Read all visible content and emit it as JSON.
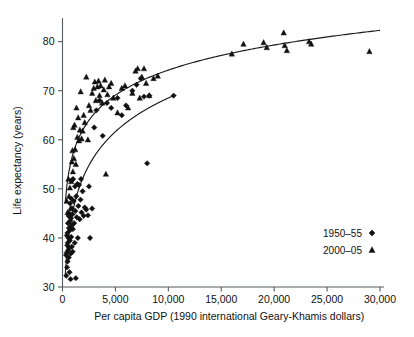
{
  "chart_data": {
    "type": "scatter",
    "title": "",
    "xlabel": "Per capita GDP (1990 international Geary-Khamis dollars)",
    "ylabel": "Life expectancy (years)",
    "xlim": [
      0,
      30000
    ],
    "ylim": [
      30,
      84
    ],
    "xticks": [
      0,
      5000,
      10000,
      15000,
      20000,
      25000,
      30000
    ],
    "xticklabels": [
      "0",
      "5,000",
      "10,000",
      "15,000",
      "20,000",
      "25,000",
      "30,000"
    ],
    "yticks": [
      30,
      40,
      50,
      60,
      70,
      80
    ],
    "yticklabels": [
      "30",
      "40",
      "50",
      "60",
      "70",
      "80"
    ],
    "grid": false,
    "legend_position": "center-right",
    "series": [
      {
        "name": "1950-55",
        "marker": "diamond",
        "color": "#111111",
        "points": [
          [
            330,
            36.5
          ],
          [
            360,
            32.3
          ],
          [
            390,
            37.0
          ],
          [
            410,
            40.5
          ],
          [
            430,
            34.0
          ],
          [
            450,
            38.5
          ],
          [
            470,
            41.0
          ],
          [
            480,
            35.2
          ],
          [
            500,
            39.0
          ],
          [
            520,
            43.0
          ],
          [
            540,
            37.5
          ],
          [
            560,
            40.0
          ],
          [
            575,
            44.5
          ],
          [
            590,
            36.0
          ],
          [
            610,
            42.0
          ],
          [
            630,
            38.0
          ],
          [
            650,
            45.0
          ],
          [
            660,
            33.0
          ],
          [
            680,
            41.5
          ],
          [
            700,
            39.5
          ],
          [
            720,
            47.0
          ],
          [
            740,
            43.5
          ],
          [
            760,
            31.6
          ],
          [
            780,
            36.8
          ],
          [
            800,
            44.0
          ],
          [
            820,
            40.2
          ],
          [
            840,
            48.0
          ],
          [
            860,
            42.5
          ],
          [
            880,
            38.2
          ],
          [
            900,
            46.0
          ],
          [
            920,
            51.8
          ],
          [
            940,
            44.8
          ],
          [
            960,
            37.2
          ],
          [
            980,
            41.8
          ],
          [
            1000,
            52.0
          ],
          [
            1050,
            47.5
          ],
          [
            1100,
            43.0
          ],
          [
            1150,
            39.0
          ],
          [
            1180,
            50.5
          ],
          [
            1220,
            45.5
          ],
          [
            1260,
            31.8
          ],
          [
            1300,
            48.5
          ],
          [
            1350,
            44.2
          ],
          [
            1400,
            51.0
          ],
          [
            1450,
            40.0
          ],
          [
            1500,
            46.5
          ],
          [
            1560,
            50.8
          ],
          [
            1620,
            43.8
          ],
          [
            1700,
            47.8
          ],
          [
            1800,
            45.2
          ],
          [
            1900,
            49.5
          ],
          [
            2000,
            44.5
          ],
          [
            2100,
            46.2
          ],
          [
            2250,
            45.8
          ],
          [
            2400,
            44.6
          ],
          [
            2600,
            40.0
          ],
          [
            2800,
            46.0
          ],
          [
            3000,
            62.5
          ],
          [
            3200,
            66.0
          ],
          [
            3500,
            68.0
          ],
          [
            3800,
            60.8
          ],
          [
            4200,
            67.5
          ],
          [
            4600,
            66.5
          ],
          [
            5200,
            68.5
          ],
          [
            5600,
            65.0
          ],
          [
            6000,
            67.0
          ],
          [
            6600,
            70.0
          ],
          [
            7000,
            71.2
          ],
          [
            7400,
            72.5
          ],
          [
            7700,
            68.8
          ],
          [
            8000,
            55.2
          ],
          [
            8200,
            69.0
          ],
          [
            10500,
            69.0
          ],
          [
            2500,
            50.5
          ],
          [
            1750,
            52.0
          ]
        ]
      },
      {
        "name": "2000-05",
        "marker": "triangle",
        "color": "#111111",
        "points": [
          [
            400,
            47.5
          ],
          [
            480,
            45.2
          ],
          [
            560,
            52.0
          ],
          [
            620,
            48.5
          ],
          [
            700,
            50.2
          ],
          [
            760,
            46.0
          ],
          [
            820,
            51.5
          ],
          [
            880,
            55.5
          ],
          [
            940,
            57.8
          ],
          [
            980,
            53.5
          ],
          [
            1020,
            62.5
          ],
          [
            1080,
            56.2
          ],
          [
            1140,
            63.0
          ],
          [
            1200,
            58.0
          ],
          [
            1260,
            55.0
          ],
          [
            1320,
            66.5
          ],
          [
            1400,
            60.5
          ],
          [
            1480,
            64.5
          ],
          [
            1560,
            59.8
          ],
          [
            1640,
            62.0
          ],
          [
            1720,
            69.8
          ],
          [
            1800,
            60.2
          ],
          [
            1900,
            61.8
          ],
          [
            2000,
            65.0
          ],
          [
            2100,
            63.5
          ],
          [
            2250,
            72.8
          ],
          [
            2400,
            60.0
          ],
          [
            2500,
            67.0
          ],
          [
            2650,
            66.0
          ],
          [
            2800,
            69.5
          ],
          [
            2950,
            70.5
          ],
          [
            3050,
            71.8
          ],
          [
            3150,
            68.0
          ],
          [
            3300,
            70.8
          ],
          [
            3400,
            72.0
          ],
          [
            3500,
            69.0
          ],
          [
            3600,
            71.0
          ],
          [
            3750,
            67.5
          ],
          [
            3900,
            70.2
          ],
          [
            4000,
            72.2
          ],
          [
            4100,
            53.0
          ],
          [
            4250,
            69.2
          ],
          [
            4400,
            70.8
          ],
          [
            4600,
            71.5
          ],
          [
            4800,
            68.5
          ],
          [
            5200,
            65.5
          ],
          [
            5600,
            70.5
          ],
          [
            5900,
            71.0
          ],
          [
            6200,
            66.5
          ],
          [
            6600,
            69.5
          ],
          [
            6900,
            74.0
          ],
          [
            7100,
            74.5
          ],
          [
            7300,
            68.5
          ],
          [
            7500,
            72.8
          ],
          [
            7700,
            74.5
          ],
          [
            7900,
            71.5
          ],
          [
            8200,
            69.0
          ],
          [
            8600,
            72.5
          ],
          [
            9000,
            73.0
          ],
          [
            16000,
            77.5
          ],
          [
            17100,
            79.5
          ],
          [
            19000,
            79.8
          ],
          [
            19300,
            78.8
          ],
          [
            20900,
            81.8
          ],
          [
            21000,
            79.2
          ],
          [
            21200,
            78.2
          ],
          [
            23300,
            80.0
          ],
          [
            23500,
            79.5
          ],
          [
            29000,
            78.0
          ]
        ]
      }
    ],
    "fit_curves": [
      {
        "name": "1950-55 fit",
        "for_series": "1950-55",
        "start": [
          250,
          32.0
        ],
        "end": [
          10500,
          69.0
        ],
        "model": "logarithmic"
      },
      {
        "name": "2000-05 fit",
        "for_series": "2000-05",
        "start": [
          250,
          47.0
        ],
        "end": [
          30000,
          82.3
        ],
        "model": "logarithmic"
      }
    ]
  },
  "legend": {
    "entries": [
      {
        "label": "1950–55",
        "marker": "diamond"
      },
      {
        "label": "2000–05",
        "marker": "triangle"
      }
    ]
  },
  "axes": {
    "x_title": "Per capita GDP (1990 international Geary-Khamis dollars)",
    "y_title": "Life expectancy (years)"
  }
}
